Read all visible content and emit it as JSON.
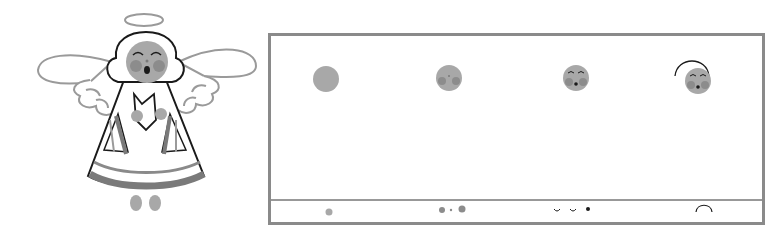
{
  "illustration": {
    "subject": "singing angel",
    "colors": {
      "outline": "#1a1a1a",
      "wing_outline": "#9a9a9a",
      "face": "#a8a8a8",
      "cheek": "#8c8c8c",
      "stripe": "#7a7a7a",
      "panel_border": "#8a8a8a"
    }
  },
  "steps_panel": {
    "step_count": 4,
    "steps": [
      {
        "index": 1,
        "description": "plain face circle",
        "hint": "single dot"
      },
      {
        "index": 2,
        "description": "face with cheeks and nose",
        "hint": "cheek dot, nose dot, cheek dot"
      },
      {
        "index": 3,
        "description": "add closed eyes and mouth",
        "hint": "two eye arcs and mouth dot"
      },
      {
        "index": 4,
        "description": "add hair outline arc",
        "hint": "arch"
      }
    ]
  }
}
